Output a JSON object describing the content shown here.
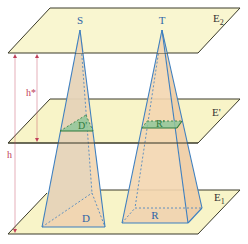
{
  "diagram": {
    "planes": {
      "top": {
        "label": "E",
        "subscript": "2"
      },
      "middle": {
        "label": "E'"
      },
      "bottom": {
        "label": "E",
        "subscript": "1"
      }
    },
    "apexes": {
      "left": "S",
      "right": "T"
    },
    "bases": {
      "left": "D",
      "right": "R"
    },
    "sections": {
      "left": "D'",
      "right": "R'"
    },
    "heights": {
      "full": "h",
      "partial": "h*"
    },
    "colors": {
      "plane_fill": "#f8f4c8",
      "plane_edge": "#3a3a2a",
      "pyramid_fill": "#f3d6b0",
      "pyramid_edge": "#3d7fc0",
      "section_fill": "#8fc79a",
      "section_edge": "#2f7a3c",
      "base_fill": "#d9d2bf",
      "arrow": "#c0405a",
      "label_blue": "#2e64a6",
      "label_green": "#2f7a3c",
      "label_dark": "#333333"
    }
  }
}
